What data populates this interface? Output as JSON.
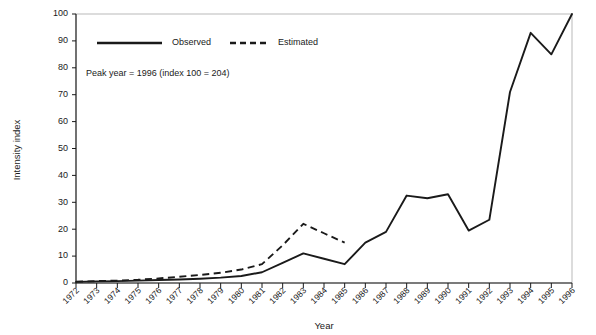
{
  "chart_data": {
    "type": "line",
    "title": "",
    "xlabel": "Year",
    "ylabel": "Intensity index",
    "annotation": "Peak year = 1996 (index 100 = 204)",
    "grid": false,
    "legend_position": "top-left-inside",
    "ylim": [
      0,
      100
    ],
    "ytick_labels": [
      "0",
      "10",
      "20",
      "30",
      "40",
      "50",
      "60",
      "70",
      "80",
      "90",
      "100"
    ],
    "yticks": [
      0,
      10,
      20,
      30,
      40,
      50,
      60,
      70,
      80,
      90,
      100
    ],
    "categories": [
      "1972",
      "1973",
      "1974",
      "1975",
      "1976",
      "1977",
      "1978",
      "1979",
      "1980",
      "1981",
      "1982",
      "1983",
      "1984",
      "1985",
      "1986",
      "1987",
      "1988",
      "1989",
      "1990",
      "1991",
      "1992",
      "1993",
      "1994",
      "1995",
      "1996"
    ],
    "x": [
      1972,
      1973,
      1974,
      1975,
      1976,
      1977,
      1978,
      1979,
      1980,
      1981,
      1982,
      1983,
      1984,
      1985,
      1986,
      1987,
      1988,
      1989,
      1990,
      1991,
      1992,
      1993,
      1994,
      1995,
      1996
    ],
    "series": [
      {
        "name": "Observed",
        "style": "solid",
        "color": "#1a1a1a",
        "x": [
          1972,
          1973,
          1974,
          1975,
          1976,
          1977,
          1978,
          1979,
          1980,
          1981,
          1982,
          1983,
          1984,
          1985,
          1986,
          1987,
          1988,
          1989,
          1990,
          1991,
          1992,
          1993,
          1994,
          1995,
          1996
        ],
        "values": [
          0.4,
          0.6,
          0.7,
          0.9,
          1.1,
          1.3,
          1.6,
          2.0,
          2.6,
          4.0,
          7.5,
          11.0,
          9.0,
          7.0,
          15.0,
          19.0,
          32.5,
          31.5,
          33.0,
          19.5,
          23.5,
          71.0,
          93.0,
          85.0,
          100.0
        ]
      },
      {
        "name": "Estimated",
        "style": "dashed",
        "color": "#1a1a1a",
        "x": [
          1972,
          1973,
          1974,
          1975,
          1976,
          1977,
          1978,
          1979,
          1980,
          1981,
          1982,
          1983,
          1984,
          1985
        ],
        "values": [
          0.5,
          0.7,
          0.9,
          1.2,
          1.7,
          2.3,
          3.0,
          3.8,
          5.0,
          7.0,
          14.0,
          22.0,
          18.5,
          15.0
        ]
      }
    ]
  },
  "legend": {
    "items": [
      {
        "label": "Observed",
        "style": "solid"
      },
      {
        "label": "Estimated",
        "style": "dashed"
      }
    ]
  },
  "axes": {
    "x_title": "Year",
    "y_title": "Intensity index"
  }
}
